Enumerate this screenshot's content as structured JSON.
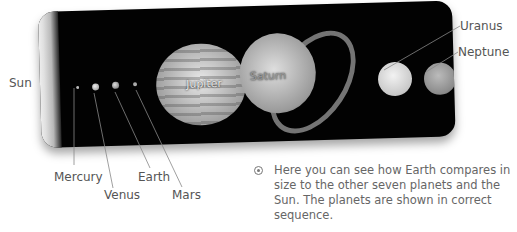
{
  "labels": {
    "sun": "Sun",
    "mercury": "Mercury",
    "venus": "Venus",
    "earth": "Earth",
    "mars": "Mars",
    "jupiter": "Jupiter",
    "saturn": "Saturn",
    "uranus": "Uranus",
    "neptune": "Neptune"
  },
  "caption": {
    "bullet_icon": "target-bullet-icon",
    "text": "Here you can see how Earth compares in size to the other seven planets and the Sun. The planets are shown in correct sequence."
  },
  "planet_order": [
    "Sun",
    "Mercury",
    "Venus",
    "Earth",
    "Mars",
    "Jupiter",
    "Saturn",
    "Uranus",
    "Neptune"
  ]
}
